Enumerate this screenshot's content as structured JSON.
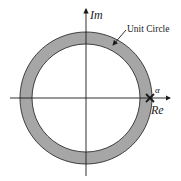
{
  "diagram": {
    "axes": {
      "imag_label": "Im",
      "real_label": "Re"
    },
    "annotation": {
      "unit_circle_label": "Unit Circle",
      "pole_label": "α"
    },
    "colors": {
      "ring_fill": "#a6a6a6",
      "stroke": "#1a1a1a",
      "background": "#ffffff"
    }
  }
}
